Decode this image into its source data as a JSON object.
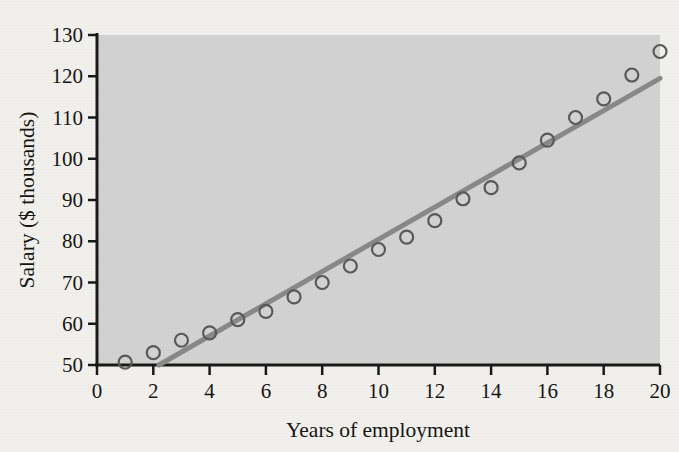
{
  "chart_data": {
    "type": "scatter",
    "title": "",
    "xlabel": "Years of employment",
    "ylabel": "Salary ($ thousands)",
    "xlim": [
      0,
      20
    ],
    "ylim": [
      50,
      130
    ],
    "xticks": [
      0,
      2,
      4,
      6,
      8,
      10,
      12,
      14,
      16,
      18,
      20
    ],
    "yticks": [
      50,
      60,
      70,
      80,
      90,
      100,
      110,
      120,
      130
    ],
    "grid": false,
    "legend": "none",
    "plot_background": "#d4d4d4",
    "page_background": "#f4f2ee",
    "marker_style": "open-circle",
    "marker_color": "#5a5a58",
    "axis_color": "#1a1a18",
    "trendline": {
      "label": "least-squares regression line",
      "color": "#8a8a88",
      "x_start": 2.2,
      "y_start": 50,
      "x_end": 20,
      "y_end": 119.5
    },
    "x": [
      1,
      2,
      3,
      4,
      5,
      6,
      7,
      8,
      9,
      10,
      11,
      12,
      13,
      14,
      15,
      16,
      17,
      18,
      19,
      20
    ],
    "values": [
      50.7,
      53.0,
      56.0,
      57.8,
      61.0,
      63.0,
      66.5,
      70.0,
      74.0,
      78.0,
      81.0,
      85.0,
      90.3,
      93.0,
      99.0,
      104.5,
      110.0,
      114.5,
      120.3,
      126.0
    ],
    "series": [
      {
        "name": "Salary by years of employment",
        "points": [
          {
            "x": 1,
            "y": 50.7
          },
          {
            "x": 2,
            "y": 53.0
          },
          {
            "x": 3,
            "y": 56.0
          },
          {
            "x": 4,
            "y": 57.8
          },
          {
            "x": 5,
            "y": 61.0
          },
          {
            "x": 6,
            "y": 63.0
          },
          {
            "x": 7,
            "y": 66.5
          },
          {
            "x": 8,
            "y": 70.0
          },
          {
            "x": 9,
            "y": 74.0
          },
          {
            "x": 10,
            "y": 78.0
          },
          {
            "x": 11,
            "y": 81.0
          },
          {
            "x": 12,
            "y": 85.0
          },
          {
            "x": 13,
            "y": 90.3
          },
          {
            "x": 14,
            "y": 93.0
          },
          {
            "x": 15,
            "y": 99.0
          },
          {
            "x": 16,
            "y": 104.5
          },
          {
            "x": 17,
            "y": 110.0
          },
          {
            "x": 18,
            "y": 114.5
          },
          {
            "x": 19,
            "y": 120.3
          },
          {
            "x": 20,
            "y": 126.0
          }
        ]
      }
    ]
  },
  "axis": {
    "y_title": "Salary ($ thousands)",
    "x_title": "Years of employment"
  }
}
